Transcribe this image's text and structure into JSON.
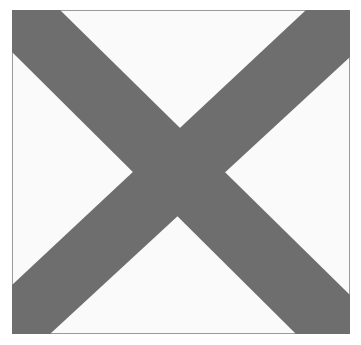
{
  "figure": {
    "colors": {
      "cross": "#6e6e6e",
      "background": "#fafafa",
      "border": "#9a9a9a"
    }
  }
}
